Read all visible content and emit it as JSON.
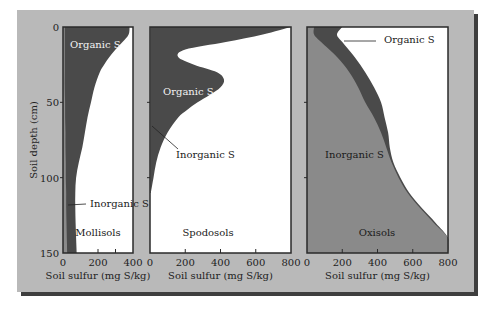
{
  "colors": {
    "background_panel": "#b9b9b9",
    "shadow": "#3e3e3e",
    "organic": "#4a4a4a",
    "inorganic": "#8a8a8a",
    "plot_bg": "#ffffff",
    "axis": "#2a2a2a"
  },
  "chart_data": [
    {
      "type": "area",
      "title": "Mollisols",
      "xlabel": "Soil sulfur (mg S/kg)",
      "ylabel": "Soil depth (cm)",
      "xlim": [
        0,
        400
      ],
      "ylim": [
        150,
        0
      ],
      "xticks": [
        0,
        200,
        400
      ],
      "xtick_labels": [
        "0",
        "200",
        "400"
      ],
      "minor_xticks": [
        300
      ],
      "yticks": [
        0,
        50,
        100,
        150
      ],
      "ytick_labels": [
        "0",
        "50",
        "100",
        "150"
      ],
      "depth": [
        0,
        5,
        10,
        15,
        20,
        25,
        30,
        40,
        50,
        60,
        70,
        80,
        90,
        100,
        110,
        120,
        130,
        140,
        150
      ],
      "series": [
        {
          "name": "Inorganic S",
          "values": [
            10,
            10,
            10,
            10,
            10,
            10,
            10,
            10,
            12,
            12,
            14,
            14,
            16,
            16,
            18,
            18,
            20,
            22,
            24
          ]
        },
        {
          "name": "Total S (Organic + Inorganic)",
          "values": [
            380,
            375,
            340,
            300,
            265,
            235,
            210,
            180,
            160,
            140,
            125,
            110,
            90,
            75,
            70,
            70,
            72,
            75,
            78
          ]
        }
      ],
      "annotations": [
        "Organic S",
        "Inorganic S"
      ]
    },
    {
      "type": "area",
      "title": "Spodosols",
      "xlabel": "Soil sulfur (mg S/kg)",
      "xlim": [
        0,
        800
      ],
      "ylim": [
        150,
        0
      ],
      "xticks": [
        0,
        200,
        400,
        600,
        800
      ],
      "xtick_labels": [
        "0",
        "200",
        "400",
        "600",
        "800"
      ],
      "depth": [
        0,
        5,
        10,
        15,
        20,
        25,
        30,
        35,
        40,
        45,
        50,
        55,
        60,
        70,
        80,
        90,
        100,
        110
      ],
      "series": [
        {
          "name": "Inorganic S",
          "values": [
            5,
            5,
            5,
            5,
            5,
            5,
            5,
            5,
            5,
            5,
            5,
            5,
            5,
            5,
            5,
            5,
            5,
            5
          ]
        },
        {
          "name": "Total S (Organic + Inorganic)",
          "values": [
            800,
            640,
            430,
            200,
            160,
            250,
            380,
            420,
            400,
            340,
            270,
            210,
            160,
            100,
            60,
            35,
            20,
            5
          ]
        }
      ],
      "annotations": [
        "Organic S",
        "Inorganic S"
      ]
    },
    {
      "type": "area",
      "title": "Oxisols",
      "xlabel": "Soil sulfur (mg S/kg)",
      "xlim": [
        0,
        800
      ],
      "ylim": [
        150,
        0
      ],
      "xticks": [
        0,
        200,
        400,
        600,
        800
      ],
      "xtick_labels": [
        "0",
        "200",
        "400",
        "600",
        "800"
      ],
      "depth": [
        0,
        5,
        10,
        20,
        30,
        40,
        50,
        60,
        70,
        80,
        90,
        100,
        110,
        120,
        130,
        140,
        150
      ],
      "series": [
        {
          "name": "Inorganic S",
          "values": [
            40,
            40,
            80,
            170,
            240,
            290,
            330,
            380,
            420,
            450,
            480,
            520,
            570,
            640,
            720,
            800,
            800
          ]
        },
        {
          "name": "Total S (Organic + Inorganic)",
          "values": [
            200,
            170,
            200,
            270,
            330,
            380,
            420,
            440,
            460,
            470,
            490,
            530,
            580,
            650,
            730,
            800,
            800
          ]
        }
      ],
      "annotations": [
        "Organic S",
        "Inorganic S"
      ]
    }
  ],
  "labels": {
    "organic": "Organic S",
    "inorganic": "Inorganic S",
    "ylabel": "Soil depth (cm)",
    "xlabel": "Soil sulfur (mg S/kg)"
  }
}
